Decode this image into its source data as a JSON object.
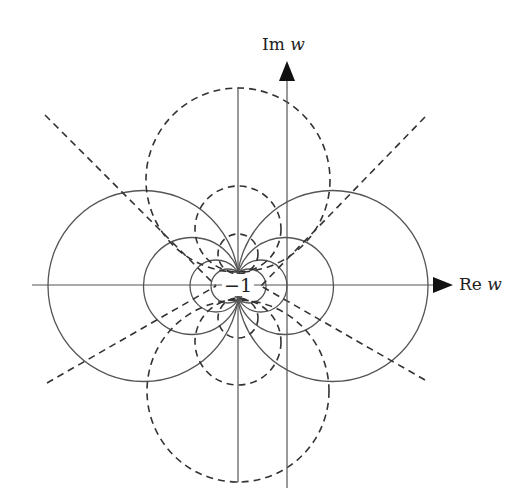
{
  "figure": {
    "axes": {
      "imaginary_label": "Im",
      "imaginary_var": "w",
      "real_label": "Re",
      "real_var": "w"
    },
    "center_point_label": "−1",
    "colors": {
      "solid": "#555555",
      "dashed": "#333333",
      "background": "#ffffff"
    },
    "solid_circles": [
      {
        "cx": 143.5,
        "cy": 286,
        "r": 95.5
      },
      {
        "cx": 332.5,
        "cy": 286,
        "r": 95.5
      },
      {
        "cx": 192,
        "cy": 286,
        "r": 48.5
      },
      {
        "cx": 285,
        "cy": 286,
        "r": 48.5
      },
      {
        "cx": 216,
        "cy": 286,
        "r": 26
      },
      {
        "cx": 261,
        "cy": 286,
        "r": 26
      },
      {
        "cx": 228,
        "cy": 286,
        "r": 17
      },
      {
        "cx": 249,
        "cy": 286,
        "r": 17
      }
    ],
    "dashed_circles": [
      {
        "cx": 238,
        "cy": 180,
        "r": 92
      },
      {
        "cx": 238,
        "cy": 391,
        "r": 91
      },
      {
        "cx": 238,
        "cy": 229,
        "r": 43
      },
      {
        "cx": 238,
        "cy": 342,
        "r": 43
      },
      {
        "cx": 238,
        "cy": 254,
        "r": 20
      },
      {
        "cx": 238,
        "cy": 318,
        "r": 20
      }
    ],
    "dashed_rays": [
      {
        "x1": 45,
        "y1": 115,
        "x2": 216,
        "y2": 286
      },
      {
        "x1": 47,
        "y1": 383,
        "x2": 216,
        "y2": 286
      },
      {
        "x1": 425,
        "y1": 117,
        "x2": 261,
        "y2": 286
      },
      {
        "x1": 425,
        "y1": 380,
        "x2": 261,
        "y2": 286
      }
    ]
  }
}
